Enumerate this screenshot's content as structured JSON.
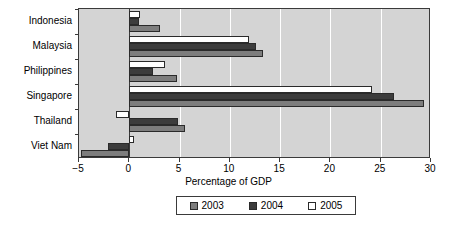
{
  "chart_data": {
    "type": "bar",
    "orientation": "horizontal",
    "title": "",
    "xlabel": "Percentage of GDP",
    "ylabel": "",
    "xlim": [
      -5,
      30
    ],
    "xticks": [
      -5,
      0,
      5,
      10,
      15,
      20,
      25,
      30
    ],
    "xtick_labels": [
      "−5",
      "0",
      "5",
      "10",
      "15",
      "20",
      "25",
      "30"
    ],
    "grid": true,
    "grid_axis": "x",
    "legend_position": "bottom",
    "categories": [
      "Indonesia",
      "Malaysia",
      "Philippines",
      "Singapore",
      "Thailand",
      "Viet Nam"
    ],
    "series": [
      {
        "name": "2003",
        "color": "#7d7d7d",
        "values": [
          3.1,
          13.3,
          4.7,
          29.3,
          5.5,
          -4.8
        ]
      },
      {
        "name": "2004",
        "color": "#3c3c3c",
        "values": [
          1.0,
          12.6,
          2.4,
          26.3,
          4.8,
          -2.1
        ]
      },
      {
        "name": "2005",
        "color": "#ffffff",
        "values": [
          1.1,
          11.9,
          3.6,
          24.1,
          -1.3,
          0.5
        ]
      }
    ]
  },
  "legend": {
    "items": [
      {
        "label": "2003",
        "swatch_class": "s2003"
      },
      {
        "label": "2004",
        "swatch_class": "s2004"
      },
      {
        "label": "2005",
        "swatch_class": "s2005"
      }
    ]
  },
  "axis": {
    "x_title": "Percentage of GDP"
  },
  "colors": {
    "plot_background": "#d4d4d4",
    "gridline": "#ffffff",
    "axis": "#3a3a3a",
    "series_2003": "#7d7d7d",
    "series_2004": "#3c3c3c",
    "series_2005": "#ffffff"
  }
}
